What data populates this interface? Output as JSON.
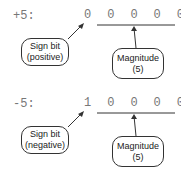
{
  "diagram": {
    "panels": [
      {
        "value_label": "+5:",
        "bits": "0 0 0 0 0 1 0 1",
        "sign_box": {
          "line1": "Sign bit",
          "line2": "(positive)"
        },
        "magnitude_box": {
          "line1": "Magnitude",
          "line2": "(5)"
        }
      },
      {
        "value_label": "-5:",
        "bits": "1 0 0 0 0 1 0 1",
        "sign_box": {
          "line1": "Sign bit",
          "line2": "(negative)"
        },
        "magnitude_box": {
          "line1": "Magnitude",
          "line2": "(5)"
        }
      }
    ],
    "colors": {
      "text": "#777777",
      "lines": "#333333",
      "background": "#ffffff"
    }
  }
}
